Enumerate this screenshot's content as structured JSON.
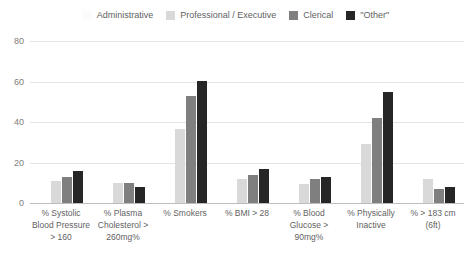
{
  "chart_data": {
    "type": "bar",
    "title": "",
    "subtitle": "",
    "xlabel": "",
    "ylabel": "",
    "ylim": [
      0,
      80
    ],
    "yticks": [
      0,
      20,
      40,
      60,
      80
    ],
    "grid": true,
    "legend_position": "top-center",
    "categories": [
      "% Systolic Blood Pressure > 160",
      "% Plasma Cholesterol > 260mg%",
      "% Smokers",
      "% BMI > 28",
      "% Blood Glucose > 90mg%",
      "% Physically Inactive",
      "% > 183 cm (6ft)"
    ],
    "series": [
      {
        "name": "Administrative",
        "color": "#fbfbfb",
        "values": [
          0,
          0,
          0,
          0,
          0,
          0,
          0
        ]
      },
      {
        "name": "Professional / Executive",
        "color": "#d9d9d9",
        "values": [
          11,
          10,
          36.5,
          12,
          9.5,
          29,
          12
        ]
      },
      {
        "name": "Clerical",
        "color": "#7f7f7f",
        "values": [
          13,
          10,
          53,
          14,
          12,
          42,
          7
        ]
      },
      {
        "name": "\"Other\"",
        "color": "#262626",
        "values": [
          16,
          8,
          60.5,
          17,
          13,
          55,
          8
        ]
      }
    ]
  },
  "legend": {
    "items": [
      {
        "label": "Administrative",
        "color": "#fbfbfb"
      },
      {
        "label": "Professional / Executive",
        "color": "#d9d9d9"
      },
      {
        "label": "Clerical",
        "color": "#7f7f7f"
      },
      {
        "label": "\"Other\"",
        "color": "#262626"
      }
    ]
  },
  "axis": {
    "yticks": [
      "80",
      "60",
      "40",
      "20",
      "0"
    ]
  }
}
